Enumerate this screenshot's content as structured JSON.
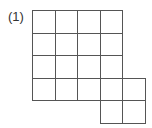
{
  "problem_label": "(1)",
  "grid": {
    "origin_x": 32,
    "origin_y": 10,
    "cell_size": 22.5,
    "cells": [
      [
        0,
        0
      ],
      [
        1,
        0
      ],
      [
        2,
        0
      ],
      [
        3,
        0
      ],
      [
        0,
        1
      ],
      [
        1,
        1
      ],
      [
        2,
        1
      ],
      [
        3,
        1
      ],
      [
        0,
        2
      ],
      [
        1,
        2
      ],
      [
        2,
        2
      ],
      [
        3,
        2
      ],
      [
        0,
        3
      ],
      [
        1,
        3
      ],
      [
        2,
        3
      ],
      [
        3,
        3
      ],
      [
        4,
        3
      ],
      [
        3,
        4
      ],
      [
        4,
        4
      ]
    ]
  }
}
